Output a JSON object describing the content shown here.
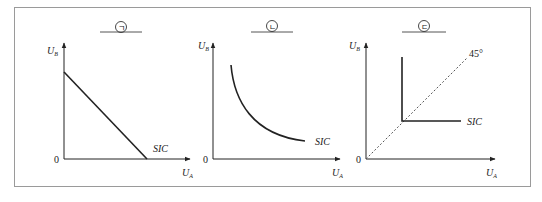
{
  "figure": {
    "panels": [
      {
        "marker": "ㄱ",
        "y_axis_label": "U",
        "y_axis_sub": "B",
        "x_axis_label": "U",
        "x_axis_sub": "A",
        "origin": "0",
        "curve_label": "SIC",
        "curve_type": "straight-line (perfect substitutes)"
      },
      {
        "marker": "ㄴ",
        "y_axis_label": "U",
        "y_axis_sub": "B",
        "x_axis_label": "U",
        "x_axis_sub": "A",
        "origin": "0",
        "curve_label": "SIC",
        "curve_type": "convex curve"
      },
      {
        "marker": "ㄷ",
        "y_axis_label": "U",
        "y_axis_sub": "B",
        "x_axis_label": "U",
        "x_axis_sub": "A",
        "origin": "0",
        "curve_label": "SIC",
        "curve_type": "L-shaped (perfect complements)",
        "diagonal_label": "45°"
      }
    ]
  }
}
